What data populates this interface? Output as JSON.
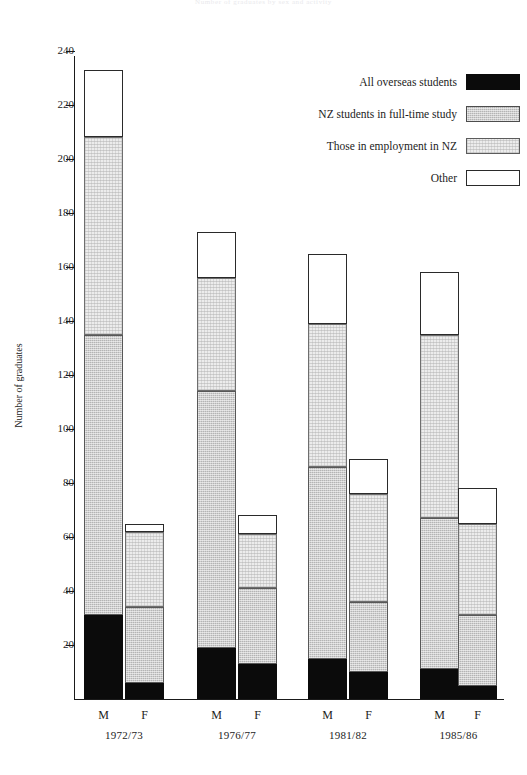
{
  "page": {
    "title": "Number of graduates by sex and activity"
  },
  "chart_data": {
    "type": "bar",
    "subtype": "stacked-bar-grouped",
    "title": "Number of graduates by sex and activity",
    "xlabel": "",
    "ylabel": "Number of graduates",
    "ylim": [
      0,
      248
    ],
    "ytick_step": 20,
    "yticks": [
      20,
      40,
      60,
      80,
      100,
      120,
      140,
      160,
      180,
      200,
      220,
      240
    ],
    "ytick_labels": [
      "20",
      "40",
      "60",
      "80",
      "100",
      "120",
      "140",
      "160",
      "180",
      "200",
      "220",
      "240"
    ],
    "grid": false,
    "legend_position": "top-right",
    "series_order": [
      "All overseas students",
      "NZ students in full-time study",
      "Those in employment in NZ",
      "Other"
    ],
    "legend": [
      {
        "label": "All overseas students",
        "key": "overseas",
        "pattern": "solid-black",
        "color": "#0b0b0b"
      },
      {
        "label": "NZ students in full-time study",
        "key": "study",
        "pattern": "mid-grey-stipple",
        "color": "#b4b4b4"
      },
      {
        "label": "Those in employment in NZ",
        "key": "employ",
        "pattern": "light-grey-stipple",
        "color": "#ececec"
      },
      {
        "label": "Other",
        "key": "other",
        "pattern": "white-outline",
        "color": "#ffffff"
      }
    ],
    "groups": [
      {
        "period": "1972/73",
        "bars": [
          {
            "sex": "M",
            "total": 233,
            "segments": {
              "overseas": 31,
              "study": 104,
              "employ": 73,
              "other": 25
            }
          },
          {
            "sex": "F",
            "total": 65,
            "segments": {
              "overseas": 6,
              "study": 28,
              "employ": 28,
              "other": 3
            }
          }
        ]
      },
      {
        "period": "1976/77",
        "bars": [
          {
            "sex": "M",
            "total": 173,
            "segments": {
              "overseas": 19,
              "study": 95,
              "employ": 42,
              "other": 17
            }
          },
          {
            "sex": "F",
            "total": 68,
            "segments": {
              "overseas": 13,
              "study": 28,
              "employ": 20,
              "other": 7
            }
          }
        ]
      },
      {
        "period": "1981/82",
        "bars": [
          {
            "sex": "M",
            "total": 165,
            "segments": {
              "overseas": 15,
              "study": 71,
              "employ": 53,
              "other": 26
            }
          },
          {
            "sex": "F",
            "total": 89,
            "segments": {
              "overseas": 10,
              "study": 26,
              "employ": 40,
              "other": 13
            }
          }
        ]
      },
      {
        "period": "1985/86",
        "bars": [
          {
            "sex": "M",
            "total": 158,
            "segments": {
              "overseas": 11,
              "study": 56,
              "employ": 68,
              "other": 23
            }
          },
          {
            "sex": "F",
            "total": 78,
            "segments": {
              "overseas": 5,
              "study": 26,
              "employ": 34,
              "other": 13
            }
          }
        ]
      }
    ]
  },
  "axis": {
    "tick_labels": [
      "240",
      "220",
      "200",
      "180",
      "160",
      "140",
      "120",
      "100",
      "80",
      "60",
      "40",
      "20"
    ],
    "y_axis_title": "Number of graduates"
  },
  "xaxis": {
    "sex_labels": [
      "M",
      "F",
      "M",
      "F",
      "M",
      "F",
      "M",
      "F"
    ],
    "group_labels": [
      "1972/73",
      "1976/77",
      "1981/82",
      "1985/86"
    ]
  },
  "legend_labels": {
    "overseas": "All overseas students",
    "study": "NZ students in full-time study",
    "employ": "Those in employment in NZ",
    "other": "Other"
  }
}
